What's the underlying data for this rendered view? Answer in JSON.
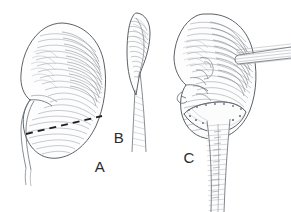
{
  "illustration": {
    "title": "Partial nephrectomy of the kidney — three-panel surgical line drawing",
    "background_color": "#ffffff",
    "ink_color": "#5a5f66",
    "outline_color": "#4a4f56",
    "hatch_color": "#8d939b",
    "dashed_line_color": "#1e1e1e",
    "label_color": "#2b2b2b",
    "style": "pen-and-ink hatched medical illustration",
    "width": 291,
    "height": 212
  },
  "panels": [
    {
      "id": "A",
      "label": "A",
      "label_x": 100,
      "label_y": 172,
      "caption": "kidney anterior view with dashed resection line across lower pole",
      "features": [
        "kidney-outline",
        "renal-hilum",
        "renal-vessels",
        "ureter",
        "dashed-resection-line",
        "cortical-hatching"
      ]
    },
    {
      "id": "B",
      "label": "B",
      "label_x": 119,
      "label_y": 143,
      "caption": "edge-on lateral view of kidney with tapering lower pole",
      "features": [
        "kidney-edge-outline",
        "tapering-shaft",
        "cortical-hatching"
      ]
    },
    {
      "id": "C",
      "label": "C",
      "label_x": 189,
      "label_y": 163,
      "caption": "kidney with surgical stapler applied across lower pole and grasper at hilum",
      "features": [
        "kidney-outline",
        "renal-vessels",
        "surgical-stapler-jaw",
        "staple-line",
        "stapler-shaft",
        "grasper-instrument",
        "cortical-hatching"
      ]
    }
  ]
}
